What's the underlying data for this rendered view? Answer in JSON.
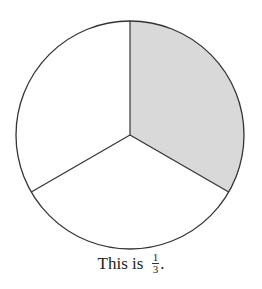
{
  "diagram": {
    "type": "fraction-circle",
    "parts": 3,
    "shaded_parts": 1,
    "shade_color": "#d9d9d9",
    "outline_color": "#333333"
  },
  "caption": {
    "prefix": "This is",
    "fraction": {
      "numerator": "1",
      "denominator": "3"
    },
    "suffix": "."
  }
}
